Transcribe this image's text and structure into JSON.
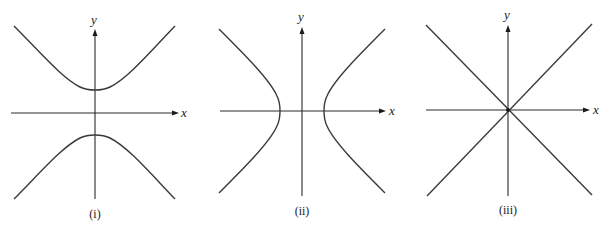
{
  "figure": {
    "colors": {
      "curve": "#3a3a3a",
      "axis": "#2a2a2a",
      "background": "#ffffff"
    },
    "panels": [
      {
        "id": "i",
        "caption": "(i)",
        "x_axis_label": "x",
        "y_axis_label": "y",
        "shape": "hyperbola-vertical",
        "equation_form": "y^2/a^2 - x^2/b^2 = 1"
      },
      {
        "id": "ii",
        "caption": "(ii)",
        "x_axis_label": "x",
        "y_axis_label": "y",
        "shape": "hyperbola-horizontal",
        "equation_form": "x^2/a^2 - y^2/b^2 = 1"
      },
      {
        "id": "iii",
        "caption": "(iii)",
        "x_axis_label": "x",
        "y_axis_label": "y",
        "shape": "crossing-lines",
        "equation_form": "x^2/a^2 - y^2/b^2 = 0"
      }
    ]
  }
}
